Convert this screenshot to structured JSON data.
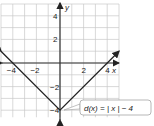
{
  "chart_data": {
    "type": "line",
    "title": "",
    "xlabel": "x",
    "ylabel": "y",
    "xlim": [
      -5,
      5
    ],
    "ylim": [
      -5,
      5
    ],
    "grid": true,
    "x_ticks": [
      -4,
      -2,
      2,
      4
    ],
    "y_ticks": [
      4,
      2,
      -2,
      -4
    ],
    "x_tick_labels": [
      "−4",
      "−2",
      "2",
      "4"
    ],
    "y_tick_labels": [
      "4",
      "2",
      "−2",
      "−4"
    ],
    "series": [
      {
        "name": "d(x) = |x| − 4",
        "x": [
          -5,
          0,
          5
        ],
        "y": [
          1,
          -4,
          1
        ]
      }
    ],
    "annotations": [
      {
        "text": "d(x) = | x | − 4",
        "points_to": [
          0,
          -4
        ]
      }
    ]
  },
  "labels": {
    "x_axis": "x",
    "y_axis": "y",
    "function_label": "d(x) = | x | − 4"
  }
}
